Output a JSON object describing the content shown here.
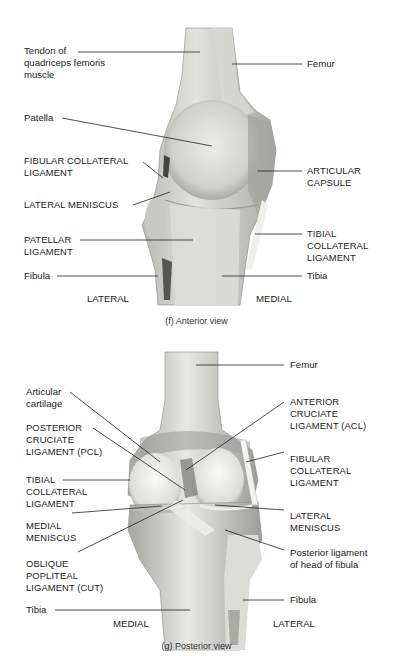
{
  "figures": [
    {
      "id": "f",
      "caption": "(f)  Anterior view",
      "side_left": "LATERAL",
      "side_right": "MEDIAL",
      "labels_left": [
        {
          "text": "Tendon of\nquadriceps femoris\nmuscle"
        },
        {
          "text": "Patella"
        },
        {
          "text": "FIBULAR COLLATERAL\nLIGAMENT"
        },
        {
          "text": "LATERAL MENISCUS"
        },
        {
          "text": "PATELLAR\nLIGAMENT"
        },
        {
          "text": "Fibula"
        }
      ],
      "labels_right": [
        {
          "text": "Femur"
        },
        {
          "text": "ARTICULAR\nCAPSULE"
        },
        {
          "text": "TIBIAL\nCOLLATERAL\nLIGAMENT"
        },
        {
          "text": "Tibia"
        }
      ]
    },
    {
      "id": "g",
      "caption": "(g) Posterior view",
      "side_left": "MEDIAL",
      "side_right": "LATERAL",
      "labels_left": [
        {
          "text": "Articular\ncartilage"
        },
        {
          "text": "POSTERIOR\nCRUCIATE\nLIGAMENT (PCL)"
        },
        {
          "text": "TIBIAL\nCOLLATERAL\nLIGAMENT"
        },
        {
          "text": "MEDIAL\nMENISCUS"
        },
        {
          "text": "OBLIQUE\nPOPLITEAL\nLIGAMENT (CUT)"
        },
        {
          "text": "Tibia"
        }
      ],
      "labels_right": [
        {
          "text": "Femur"
        },
        {
          "text": "ANTERIOR\nCRUCIATE\nLIGAMENT (ACL)"
        },
        {
          "text": "FIBULAR\nCOLLATERAL\nLIGAMENT"
        },
        {
          "text": "LATERAL\nMENISCUS"
        },
        {
          "text": "Posterior ligament\nof head of fibula"
        },
        {
          "text": "Fibula"
        }
      ]
    }
  ],
  "colors": {
    "background": "#ffffff",
    "leader_line": "#222222",
    "specimen_light": "#e6e6e2",
    "specimen_mid": "#c4c4c0",
    "specimen_dark": "#8c8c88"
  }
}
